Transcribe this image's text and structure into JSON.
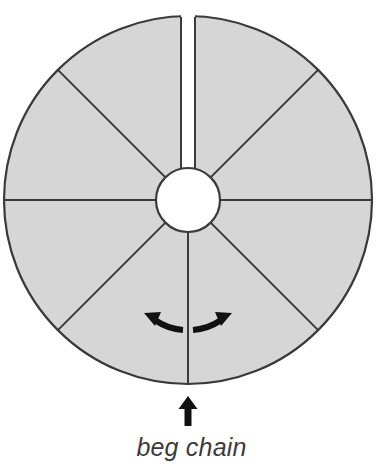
{
  "figure": {
    "kind": "crochet-round-motif-diagram",
    "caption": "beg chain",
    "colors": {
      "wedge_fill": "#d6d6d6",
      "outline": "#3a3a3a",
      "hub_fill": "#ffffff",
      "arrow": "#111111",
      "caption_text": "#3b3b3b",
      "background": "#ffffff"
    },
    "circle": {
      "center_x": 188,
      "center_y": 200,
      "outer_radius": 184,
      "hub_radius": 32,
      "stroke_width": 2.2
    },
    "spokes": {
      "count": 8,
      "angles_deg": [
        90,
        135,
        180,
        225,
        270,
        315,
        0,
        45
      ],
      "note": "radial division lines from hub to outer edge"
    },
    "top_gap": {
      "label": "slit-opening",
      "half_width_px": 7,
      "description": "vertical white gap splitting the motif at top center"
    },
    "markers": {
      "up_arrow": {
        "name": "beg-chain-pointer",
        "direction": "up",
        "x": 188,
        "y_tip": 396,
        "y_tail": 425
      },
      "left_arrow": {
        "name": "work-direction-left",
        "direction": "left"
      },
      "right_arrow": {
        "name": "work-direction-right",
        "direction": "right"
      }
    }
  }
}
